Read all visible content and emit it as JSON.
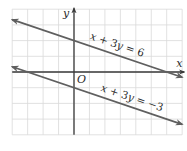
{
  "chart_data": {
    "type": "line",
    "title": "",
    "xlabel": "x",
    "ylabel": "y",
    "origin_label": "O",
    "xlim": [
      -4,
      7
    ],
    "ylim": [
      -4,
      4
    ],
    "grid": true,
    "grid_step": 1,
    "tick_labels": false,
    "series": [
      {
        "name": "x + 3y = 6",
        "equation": "x + 3y = 6",
        "slope": -0.3333,
        "y_intercept": 2,
        "x_intercept": 6,
        "points": [
          [
            -4,
            3.333
          ],
          [
            7,
            -0.333
          ]
        ],
        "arrows_both_ends": true,
        "color": "#5f5f5f"
      },
      {
        "name": "x + 3y = −3",
        "equation": "x + 3y = −3",
        "slope": -0.3333,
        "y_intercept": -1,
        "x_intercept": -3,
        "points": [
          [
            -4,
            0.333
          ],
          [
            7,
            -3.333
          ]
        ],
        "arrows_both_ends": true,
        "color": "#5f5f5f"
      }
    ],
    "annotations": [
      {
        "text": "x + 3y = 6",
        "near_series": 0,
        "anchor": [
          1,
          2.1
        ],
        "rotation_deg": 18.4
      },
      {
        "text": "x + 3y = −3",
        "near_series": 1,
        "anchor": [
          1.7,
          -1.2
        ],
        "rotation_deg": 18.4
      }
    ]
  },
  "colors": {
    "grid": "#d9d9d9",
    "axis": "#3a3a3a",
    "line": "#5f5f5f",
    "text": "#2b2b2b"
  }
}
